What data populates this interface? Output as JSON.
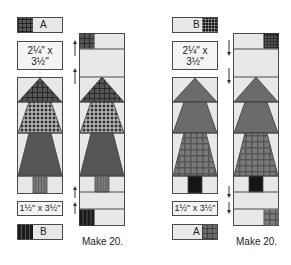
{
  "diagram": {
    "type": "quilt-block-assembly",
    "groups": [
      {
        "id": "left",
        "top_strip": {
          "label": "A",
          "swatch": "dark-plaid",
          "swatch_side": "left"
        },
        "top_spacer": {
          "label_line1": "2¼\" x",
          "label_line2": "3½\""
        },
        "tree": {
          "tiers": [
            {
              "fabric": "dark-plaid"
            },
            {
              "fabric": "gray-check-plaid"
            },
            {
              "fabric": "solid-dark-gray"
            }
          ],
          "trunk": {
            "fabric": "medium-gray-stripe"
          }
        },
        "bottom_spacer": {
          "label": "1½\" x 3½\""
        },
        "bottom_strip": {
          "label": "B",
          "swatch": "black-stripe",
          "swatch_side": "left"
        },
        "assembled_caption": "Make 20.",
        "pressing_arrows": "up"
      },
      {
        "id": "right",
        "top_strip": {
          "label": "B",
          "swatch": "black-check",
          "swatch_side": "right"
        },
        "top_spacer": {
          "label_line1": "2¼\" x",
          "label_line2": "3½\""
        },
        "tree": {
          "tiers": [
            {
              "fabric": "solid-gray"
            },
            {
              "fabric": "solid-gray"
            },
            {
              "fabric": "gray-plaid"
            }
          ],
          "trunk": {
            "fabric": "black"
          }
        },
        "bottom_spacer": {
          "label": "1½\" x 3½\""
        },
        "bottom_strip": {
          "label": "A",
          "swatch": "dark-plaid",
          "swatch_side": "right"
        },
        "assembled_caption": "Make 20.",
        "pressing_arrows": "down"
      }
    ]
  },
  "colors": {
    "background": "#ffffff",
    "piece_bg": "#e8e8e8",
    "outline": "#4a4a4a",
    "tree_gray": "#6b6b6b",
    "tree_dark": "#4e4e4e",
    "black": "#151515"
  }
}
